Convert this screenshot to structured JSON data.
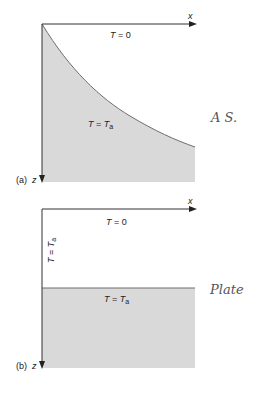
{
  "figure": {
    "panels": [
      {
        "id": "a",
        "caption": "(a)",
        "x_axis_label": "x",
        "z_axis_label": "z",
        "upper_region_label": {
          "var": "T",
          "eq": "=",
          "val": "0"
        },
        "lower_region_label": {
          "var": "T",
          "eq": "=",
          "val": "T",
          "sub": "a"
        },
        "boundary": "curved",
        "annotation": "A S."
      },
      {
        "id": "b",
        "caption": "(b)",
        "x_axis_label": "x",
        "z_axis_label": "z",
        "upper_region_label": {
          "var": "T",
          "eq": "=",
          "val": "0"
        },
        "lower_region_label": {
          "var": "T",
          "eq": "=",
          "val": "T",
          "sub": "a"
        },
        "side_label": {
          "var": "T",
          "eq": "=",
          "val": "T",
          "sub": "a"
        },
        "boundary": "horizontal",
        "annotation": "Plate"
      }
    ],
    "colors": {
      "shade": "#d9d9d9",
      "axis": "#333333",
      "boundary": "#6e6e6e",
      "handwriting": "#555555"
    }
  }
}
